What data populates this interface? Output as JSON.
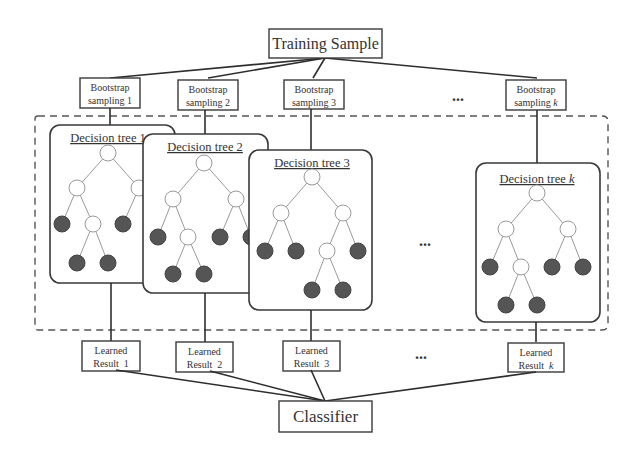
{
  "training_sample": {
    "label": "Training Sample"
  },
  "bootstrap": [
    {
      "line1": "Bootstrap",
      "line2": "sampling 1"
    },
    {
      "line1": "Bootstrap",
      "line2": "sampling 2"
    },
    {
      "line1": "Bootstrap",
      "line2": "sampling 3"
    },
    {
      "line1": "Bootstrap",
      "line2": "sampling ",
      "var": "k"
    }
  ],
  "trees": [
    {
      "label": "Decision tree 1"
    },
    {
      "label": "Decision tree 2"
    },
    {
      "label": "Decision tree 3"
    },
    {
      "label": "Decision tree ",
      "var": "k"
    }
  ],
  "learned": [
    {
      "line1": "Learned",
      "line2": "Result  1"
    },
    {
      "line1": "Learned",
      "line2": "Result  2"
    },
    {
      "line1": "Learned",
      "line2": "Result  3"
    },
    {
      "line1": "Learned",
      "line2": "Result  ",
      "var": "k"
    }
  ],
  "ellipsis": "...",
  "classifier": {
    "label": "Classifier"
  },
  "colors": {
    "stroke": "#3a3a3a",
    "leaf_fill": "#555555",
    "branch": "#9a9a9a"
  }
}
